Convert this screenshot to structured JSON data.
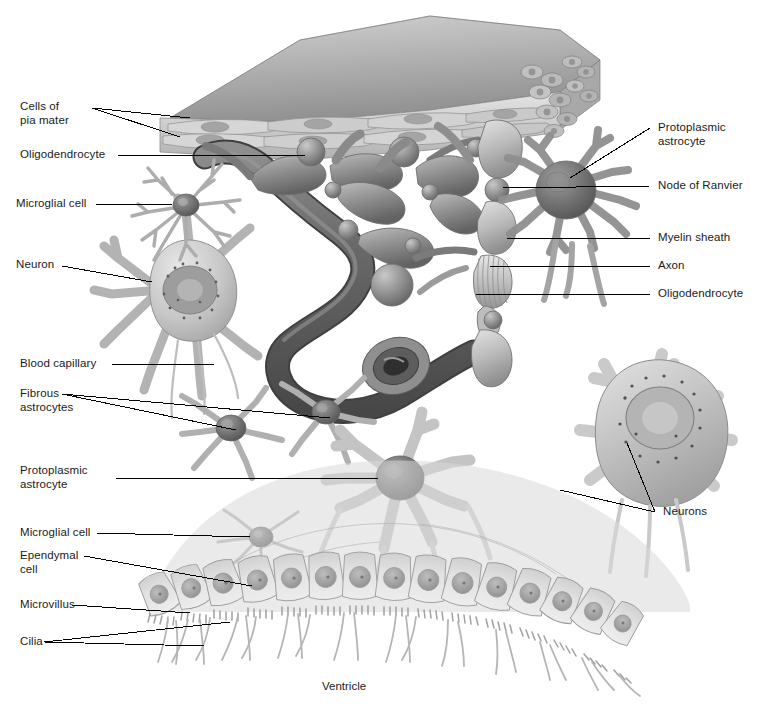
{
  "figure": {
    "caption": "Ventricle",
    "palette": {
      "background": "#ffffff",
      "line": "#000000",
      "text": "#1a1a1a",
      "pia_top": "#b9b9b9",
      "pia_top_dark": "#8d8d8d",
      "pia_cells": "#cfcfcf",
      "capillary_dark": "#575757",
      "capillary_mid": "#7d7d7d",
      "glia_light": "#d6d6d6",
      "glia_mid": "#a9a9a9",
      "glia_dark": "#6e6e6e",
      "astrocyte_soma": "#6b6b6b",
      "neuron_body": "#c2c2c2",
      "ependyma": "#dcdcdc",
      "nucleus": "#9a9a9a",
      "outline": "#4a4a4a"
    }
  },
  "labels_left": [
    {
      "id": "cells-of-pia-mater",
      "text": "Cells of\npia mater"
    },
    {
      "id": "oligodendrocyte-left",
      "text": "Oligodendrocyte"
    },
    {
      "id": "microglial-cell-upper",
      "text": "Microglial cell"
    },
    {
      "id": "neuron-left",
      "text": "Neuron"
    },
    {
      "id": "blood-capillary",
      "text": "Blood capillary"
    },
    {
      "id": "fibrous-astrocytes",
      "text": "Fibrous\nastrocytes"
    },
    {
      "id": "protoplasmic-astrocyte-left",
      "text": "Protoplasmic\nastrocyte"
    },
    {
      "id": "microglial-cell-lower",
      "text": "Microglial cell"
    },
    {
      "id": "ependymal-cell",
      "text": "Ependymal\ncell"
    },
    {
      "id": "microvillus",
      "text": "Microvillus"
    },
    {
      "id": "cilia",
      "text": "Cilia"
    }
  ],
  "labels_right": [
    {
      "id": "protoplasmic-astrocyte-right",
      "text": "Protoplasmic\nastrocyte"
    },
    {
      "id": "node-of-ranvier",
      "text": "Node of Ranvier"
    },
    {
      "id": "myelin-sheath",
      "text": "Myelin sheath"
    },
    {
      "id": "axon",
      "text": "Axon"
    },
    {
      "id": "oligodendrocyte-right",
      "text": "Oligodendrocyte"
    },
    {
      "id": "neurons-right",
      "text": "Neurons"
    }
  ]
}
